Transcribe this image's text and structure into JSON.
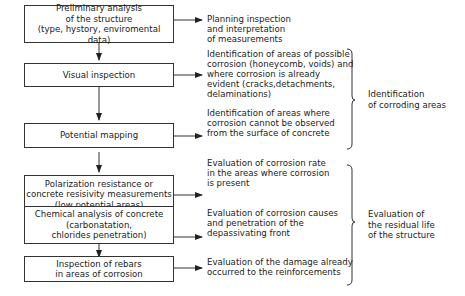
{
  "steps": [
    {
      "lines": [
        "Preliminary analysis",
        "of the structure",
        "(type, hystory, enviromental data)"
      ],
      "outcome": [
        "Planning inspection",
        "and interpretation",
        "of measurements"
      ]
    },
    {
      "lines": [
        "Visual inspection"
      ],
      "outcome": [
        "Identification of areas of possible",
        "corrosion (honeycomb, voids) and",
        "where corrosion is already",
        "evident (cracks,detachments,",
        "delaminations)"
      ]
    },
    {
      "lines": [
        "Potential mapping"
      ],
      "outcome": [
        "Identification of areas where",
        "corrosion cannot be observed",
        "from the surface of concrete"
      ]
    },
    {
      "lines": [
        "Polarization resistance or",
        "concrete resisivity measurements",
        "(low potential areas)"
      ],
      "outcome": [
        "Evaluation of corrosion rate",
        "in the areas where corrosion",
        "is present"
      ]
    },
    {
      "lines": [
        "Chemical analysis of concrete",
        "(carbonatation,",
        "chlorides penetration)"
      ],
      "outcome": [
        "Evaluation of corrosion causes",
        "and penetration of the",
        "depassivating front"
      ]
    },
    {
      "lines": [
        "Inspection of rebars",
        "in areas of corrosion"
      ],
      "outcome": [
        "Evaluation of the damage already",
        "occurred to the reinforcements"
      ]
    }
  ],
  "groups": [
    {
      "lines": [
        "Identification",
        "of corroding areas"
      ]
    },
    {
      "lines": [
        "Evaluation of",
        "the residual life",
        "of the structure"
      ]
    }
  ],
  "colors": {
    "stroke": "#333333",
    "text": "#222222",
    "background": "#ffffff"
  }
}
